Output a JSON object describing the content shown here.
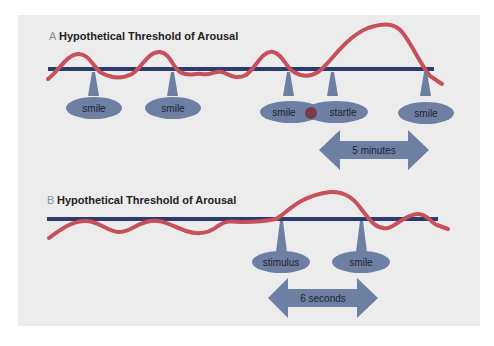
{
  "colors": {
    "background": "#ececec",
    "wave": "#c8505a",
    "threshold": "#2e3b6e",
    "ellipse": "#6e7fa4",
    "overlap_dot": "#7a3a4a",
    "arrow": "#6e7fa4"
  },
  "panel_a": {
    "letter": "A",
    "title": "Hypothetical Threshold of Arousal",
    "labels": [
      "smile",
      "smile",
      "smile",
      "startle",
      "smile"
    ],
    "duration": "5 minutes"
  },
  "panel_b": {
    "letter": "B",
    "title": "Hypothetical Threshold of Arousal",
    "labels": [
      "stimulus",
      "smile"
    ],
    "duration": "6 seconds"
  }
}
